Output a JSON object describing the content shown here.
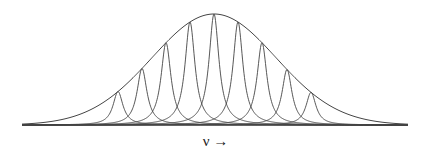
{
  "diagram": {
    "title": "",
    "stroke_color": "#444444",
    "baseline": {
      "x_start": 22,
      "x_end": 408,
      "y": 125
    },
    "envelope": {
      "center_x": 214,
      "peak_y": 14,
      "sigma_px": 62
    },
    "peaks": [
      {
        "x": 118
      },
      {
        "x": 142
      },
      {
        "x": 166
      },
      {
        "x": 190
      },
      {
        "x": 214
      },
      {
        "x": 238
      },
      {
        "x": 262
      },
      {
        "x": 287
      },
      {
        "x": 311
      }
    ],
    "peak_half_width_px": 6,
    "x_axis_label": "ν →"
  }
}
